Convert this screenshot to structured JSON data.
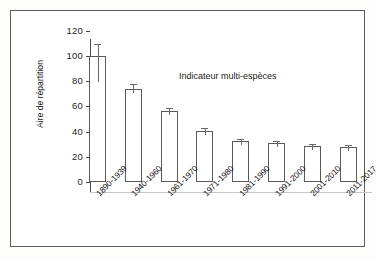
{
  "figure": {
    "frame_color": "#5d5d5d",
    "background": "#ffffff"
  },
  "chart_data": {
    "type": "bar",
    "title": "Indicateur multi-espèces",
    "xlabel": "",
    "ylabel": "Aire de répartition",
    "categories": [
      "1890-1939",
      "1940-1960",
      "1961-1970",
      "1971-1980",
      "1981-1990",
      "1991-2000",
      "2001-2010",
      "2011-2017"
    ],
    "values": [
      100,
      74,
      56.5,
      40.5,
      32.5,
      31,
      28.5,
      27.5
    ],
    "errors": [
      9.5,
      3.5,
      2.0,
      2.0,
      1.5,
      1.5,
      1.5,
      1.5
    ],
    "ylim": [
      0,
      120
    ],
    "yticks": [
      "0",
      "20",
      "40",
      "60",
      "80",
      "100",
      "120"
    ],
    "ytick_values": [
      0,
      20,
      40,
      60,
      80,
      100,
      120
    ],
    "grid": false,
    "legend": "none",
    "bar_fill": "#ffffff",
    "bar_edge": "#5a5a5a",
    "error_color": "#6a6a6a"
  }
}
